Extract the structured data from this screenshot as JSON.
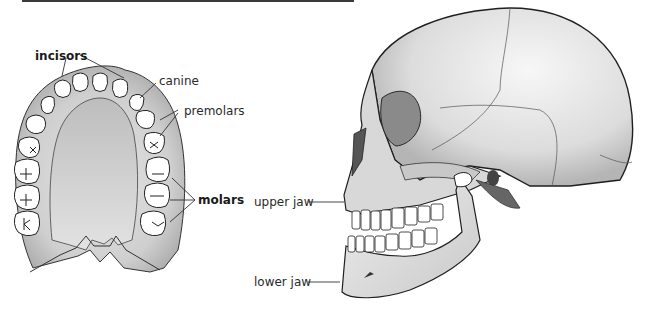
{
  "diagram": {
    "type": "anatomy-illustration",
    "panels": [
      {
        "id": "upper-dental-arch",
        "view": "top view of upper teeth",
        "labels": [
          {
            "key": "incisors",
            "text": "incisors",
            "bold": true
          },
          {
            "key": "canine",
            "text": "canine",
            "bold": false
          },
          {
            "key": "premolars",
            "text": "premolars",
            "bold": false
          },
          {
            "key": "molars",
            "text": "molars",
            "bold": true
          }
        ]
      },
      {
        "id": "skull-side",
        "view": "side view of human skull",
        "labels": [
          {
            "key": "upper_jaw",
            "text": "upper jaw",
            "bold": false
          },
          {
            "key": "lower_jaw",
            "text": "lower jaw",
            "bold": false
          }
        ]
      }
    ],
    "colors": {
      "gum": "#cfcfcf",
      "palate": "#dedede",
      "tooth": "#ffffff",
      "bone": "#e4e4e4",
      "shadow": "#8a8a8a",
      "outline": "#222222",
      "label": "#2a2a2a"
    }
  },
  "labels": {
    "incisors": "incisors",
    "canine": "canine",
    "premolars": "premolars",
    "molars": "molars",
    "upper_jaw": "upper jaw",
    "lower_jaw": "lower jaw"
  }
}
